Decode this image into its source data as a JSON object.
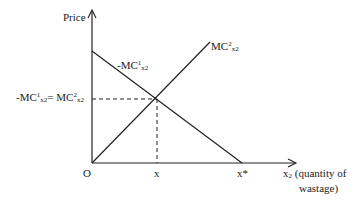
{
  "diagram": {
    "y_axis_label": "Price",
    "x_axis_label_line1": "(quantity of",
    "x_axis_label_line2": "wastage)",
    "x_axis_var": "x",
    "x_axis_var_sub": "2",
    "origin_label": "O",
    "tick_x_label": "x",
    "tick_xstar_label": "x*",
    "curves": [
      {
        "name": "-MC1x2",
        "prefix": "-MC",
        "sup": "1",
        "sub": "x2",
        "type": "downward sloping line"
      },
      {
        "name": "MC2x2",
        "prefix": "MC",
        "sup": "2",
        "sub": "x2",
        "type": "upward sloping line from origin"
      }
    ],
    "equilibrium_label": {
      "left_prefix": "-MC",
      "left_sup": "1",
      "left_sub": "x2",
      "eq": "= ",
      "right_prefix": "MC",
      "right_sup": "2",
      "right_sub": "x2"
    }
  }
}
